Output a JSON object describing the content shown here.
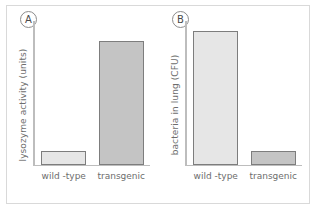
{
  "figure": {
    "background_color": "#ffffff",
    "frame_color": "#d9d9d9",
    "axis_color": "#bdbdbd",
    "bar_border_color": "#7d7d7d",
    "text_color": "#6d6d6d"
  },
  "panels": [
    {
      "badge": "A",
      "ylabel": "lysozyme activity (units)",
      "categories": [
        "wild -type",
        "transgenic"
      ]
    },
    {
      "badge": "B",
      "ylabel": "bacteria in lung (CFU)",
      "categories": [
        "wild -type",
        "transgenic"
      ]
    }
  ],
  "chart_data": [
    {
      "type": "bar",
      "panel": "A",
      "title": "",
      "xlabel": "",
      "ylabel": "lysozyme activity (units)",
      "categories": [
        "wild -type",
        "transgenic"
      ],
      "values": [
        10,
        86
      ],
      "ylim": [
        0,
        100
      ],
      "grid": false,
      "legend": "none",
      "bar_colors": [
        "#e6e6e6",
        "#c4c4c4"
      ],
      "bar_border_color": "#7d7d7d",
      "axis_tick_labels": [],
      "notes": "Transgenic shows much higher lysozyme activity than wild-type; axis is unscaled (no numeric ticks)."
    },
    {
      "type": "bar",
      "panel": "B",
      "title": "",
      "xlabel": "",
      "ylabel": "bacteria in lung (CFU)",
      "categories": [
        "wild -type",
        "transgenic"
      ],
      "values": [
        93,
        10
      ],
      "ylim": [
        0,
        100
      ],
      "grid": false,
      "legend": "none",
      "bar_colors": [
        "#e6e6e6",
        "#c4c4c4"
      ],
      "bar_border_color": "#7d7d7d",
      "axis_tick_labels": [],
      "notes": "Wild-type shows much higher bacterial load than transgenic; axis is unscaled (no numeric ticks)."
    }
  ]
}
